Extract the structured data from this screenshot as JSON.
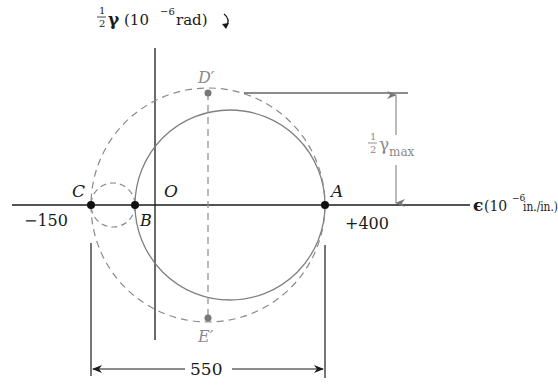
{
  "diagram": {
    "type": "Mohr's circle for strain",
    "y_axis_label": {
      "fraction_num": "1",
      "fraction_den": "2",
      "symbol": "γ",
      "units": "(10",
      "exponent": "−6",
      "units_end": " rad)",
      "rotation_marker": "↻"
    },
    "x_axis_label": {
      "symbol": "ϵ",
      "units": "(10",
      "exponent": "−6",
      "units_end": " in./in.)"
    },
    "points": {
      "C": {
        "label": "C",
        "value": "−150"
      },
      "B": {
        "label": "B"
      },
      "O": {
        "label": "O"
      },
      "A": {
        "label": "A",
        "value": "+400"
      },
      "D_prime": {
        "label": "D′"
      },
      "E_prime": {
        "label": "E′"
      }
    },
    "dimensions": {
      "width_label": "550",
      "gamma_max_label": {
        "fraction_num": "1",
        "fraction_den": "2",
        "symbol": "γ",
        "subscript": "max"
      }
    },
    "colors": {
      "ink": "#1a1a1a",
      "circle": "#808080",
      "dashed": "#8a8a8a"
    }
  }
}
